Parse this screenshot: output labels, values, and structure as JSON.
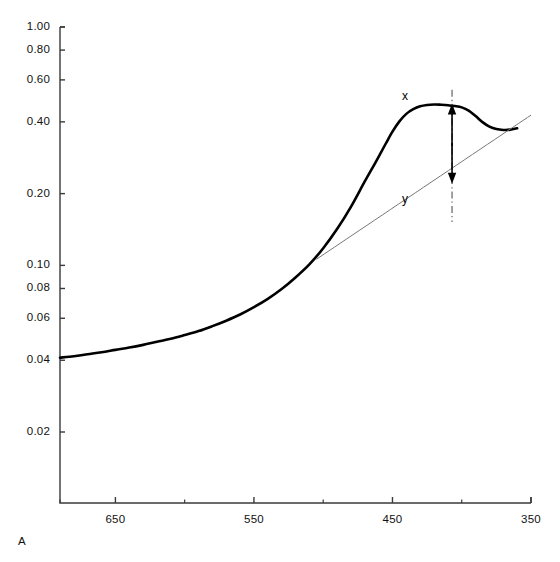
{
  "figure": {
    "corner_label": "A",
    "background": "#ffffff",
    "curve_color": "#000000",
    "baseline_color": "#777777",
    "axis_color": "#3a3a3a",
    "guide_color": "#555555"
  },
  "annotations": [
    {
      "name": "peak-height-label",
      "text": "x",
      "x": 402,
      "y": 89
    },
    {
      "name": "baseline-height-label",
      "text": "y",
      "x": 402,
      "y": 192
    }
  ],
  "chart_data": {
    "type": "line",
    "title": "",
    "subtitle": "",
    "xlabel": "",
    "ylabel": "",
    "yscale": "log",
    "xscale": "linear",
    "grid": false,
    "legend": null,
    "xlim": [
      690,
      350
    ],
    "ylim": [
      0.013,
      1.0
    ],
    "x_ticks": [
      650,
      550,
      450,
      350
    ],
    "x_tick_labels": [
      "650",
      "550",
      "450",
      "350"
    ],
    "x_minor_ticks": [
      690,
      600,
      500,
      400
    ],
    "y_ticks": [
      1.0,
      0.8,
      0.6,
      0.4,
      0.2,
      0.1,
      0.08,
      0.06,
      0.04,
      0.02
    ],
    "y_tick_labels": [
      "1.00",
      "0.80",
      "0.60",
      "0.40",
      "0.20",
      "0.10",
      "0.08",
      "0.06",
      "0.04",
      "0.02"
    ],
    "series": [
      {
        "name": "absorbance-spectrum",
        "style": "solid-thick",
        "x": [
          690,
          680,
          670,
          660,
          650,
          640,
          630,
          620,
          610,
          600,
          590,
          580,
          570,
          560,
          550,
          540,
          530,
          520,
          510,
          500,
          490,
          480,
          470,
          462,
          455,
          450,
          445,
          440,
          435,
          430,
          425,
          420,
          415,
          410,
          405,
          400,
          395,
          390,
          385,
          380,
          375,
          370,
          365,
          360
        ],
        "y": [
          0.041,
          0.0416,
          0.0424,
          0.0432,
          0.0442,
          0.0452,
          0.0464,
          0.0478,
          0.0492,
          0.051,
          0.053,
          0.0556,
          0.0586,
          0.0622,
          0.0668,
          0.0724,
          0.0796,
          0.089,
          0.101,
          0.118,
          0.142,
          0.176,
          0.225,
          0.272,
          0.323,
          0.364,
          0.402,
          0.432,
          0.452,
          0.465,
          0.471,
          0.473,
          0.472,
          0.47,
          0.466,
          0.46,
          0.446,
          0.423,
          0.399,
          0.382,
          0.373,
          0.37,
          0.371,
          0.376
        ]
      },
      {
        "name": "tangent-baseline",
        "style": "solid-thin",
        "x": [
          505,
          350
        ],
        "y": [
          0.106,
          0.427
        ]
      },
      {
        "name": "peak-measure-guide",
        "style": "dash-dot-vertical",
        "x": [
          407,
          407
        ],
        "y": [
          0.545,
          0.152
        ]
      }
    ],
    "measurements": {
      "peak_wavelength": 407,
      "peak_absorbance": 0.473,
      "baseline_absorbance_at_peak": 0.222,
      "x_label_meaning": "peak absorbance above baseline",
      "y_label_meaning": "baseline absorbance at peak wavelength"
    }
  }
}
